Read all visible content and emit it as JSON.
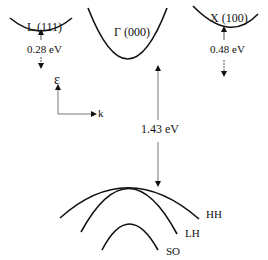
{
  "diagram": {
    "type": "band-structure",
    "valleys": [
      {
        "id": "L",
        "label": "L (111)",
        "gap_label": "0.28 eV"
      },
      {
        "id": "Gamma",
        "label": "Γ (000)",
        "gap_label": "1.43 eV"
      },
      {
        "id": "X",
        "label": "X (100)",
        "gap_label": "0.48 eV"
      }
    ],
    "axes": {
      "energy_label": "ε",
      "k_label": "k"
    },
    "valence_bands": [
      {
        "id": "HH",
        "label": "HH"
      },
      {
        "id": "LH",
        "label": "LH"
      },
      {
        "id": "SO",
        "label": "SO"
      }
    ],
    "colors": {
      "line": "#111111",
      "arrow": "#555555"
    }
  }
}
